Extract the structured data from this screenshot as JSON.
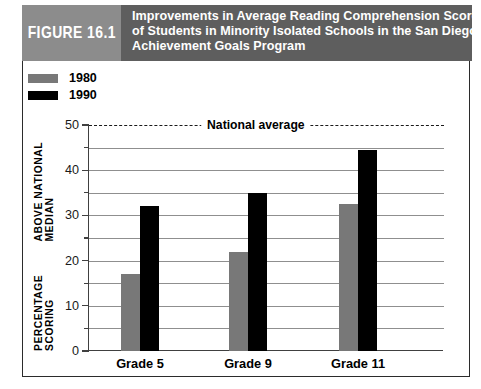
{
  "figure": {
    "tag_label": "FIGURE 16.1",
    "title_lines": [
      "Improvements in Average Reading Comprehension Scores",
      "of Students in Minority Isolated Schools in the San Diego",
      "Achievement Goals Program"
    ],
    "tag_bg": "#8c8c8c",
    "band_bg": "#5e5e5e",
    "border_color": "#2b2b2b"
  },
  "legend": {
    "position": "top-left",
    "items": [
      {
        "label": "1980",
        "color": "#787878",
        "swatch": "gray-swatch"
      },
      {
        "label": "1990",
        "color": "#000000",
        "swatch": "black-swatch"
      }
    ]
  },
  "chart_data": {
    "type": "bar",
    "title": "Improvements in Average Reading Comprehension Scores of Students in Minority Isolated Schools in the San Diego Achievement Goals Program",
    "categories": [
      "Grade 5",
      "Grade 9",
      "Grade 11"
    ],
    "series": [
      {
        "name": "1980",
        "color": "#787878",
        "values": [
          17,
          22,
          32.5
        ]
      },
      {
        "name": "1990",
        "color": "#000000",
        "values": [
          32,
          35,
          44.5
        ]
      }
    ],
    "xlabel": "",
    "ylabel": "PERCENTAGE SCORING ABOVE NATIONAL MEDIAN",
    "ylabel_line1": "PERCENTAGE SCORING",
    "ylabel_line2": "ABOVE NATIONAL MEDIAN",
    "ylim": [
      0,
      50
    ],
    "ytick_values": [
      0,
      10,
      20,
      30,
      40,
      50
    ],
    "ytick_labels": [
      "0",
      "10",
      "20",
      "30",
      "40",
      "50"
    ],
    "yminor_values": [
      5,
      15,
      25,
      35,
      45
    ],
    "gridline_values": [
      5,
      10,
      15,
      20,
      25,
      30,
      35,
      40,
      45
    ],
    "grid": true,
    "legend_position": "above-plot-left",
    "annotations": [
      {
        "name": "national-average",
        "text": "National average",
        "value": 50,
        "style": "dashed-horizontal-line"
      }
    ]
  }
}
